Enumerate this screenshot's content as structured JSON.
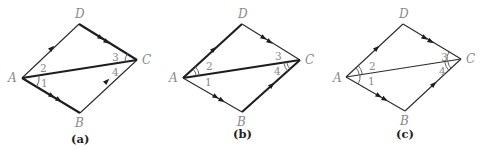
{
  "figure": {
    "panels": [
      {
        "caption": "(a)",
        "vertices": {
          "A": "A",
          "B": "B",
          "C": "C",
          "D": "D"
        },
        "angles": {
          "1": "1",
          "2": "2",
          "3": "3",
          "4": "4"
        },
        "highlighted_segments": [
          "AB",
          "DC",
          "AC"
        ],
        "marked_angles": [
          "1",
          "3"
        ]
      },
      {
        "caption": "(b)",
        "vertices": {
          "A": "A",
          "B": "B",
          "C": "C",
          "D": "D"
        },
        "angles": {
          "1": "1",
          "2": "2",
          "3": "3",
          "4": "4"
        },
        "highlighted_segments": [
          "AD",
          "BC",
          "AC"
        ],
        "marked_angles": [
          "2",
          "4"
        ]
      },
      {
        "caption": "(c)",
        "vertices": {
          "A": "A",
          "B": "B",
          "C": "C",
          "D": "D"
        },
        "angles": {
          "1": "1",
          "2": "2",
          "3": "3",
          "4": "4"
        },
        "highlighted_segments": [],
        "marked_angles": [
          "1",
          "2",
          "3",
          "4"
        ]
      }
    ]
  }
}
